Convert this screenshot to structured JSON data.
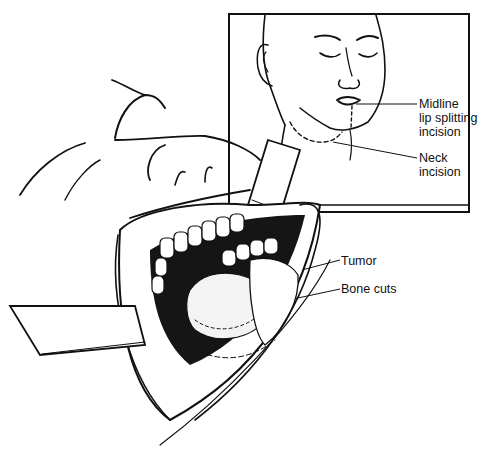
{
  "figure": {
    "colors": {
      "ink": "#111111",
      "background": "#ffffff"
    },
    "labels": {
      "midline": "Midline\nlip splitting\nincision",
      "neck": "Neck\nincision",
      "tumor": "Tumor",
      "bone_cuts": "Bone cuts"
    },
    "inset": {
      "description": "Face with dashed incision lines",
      "box": [
        229,
        14,
        469,
        211
      ]
    }
  }
}
